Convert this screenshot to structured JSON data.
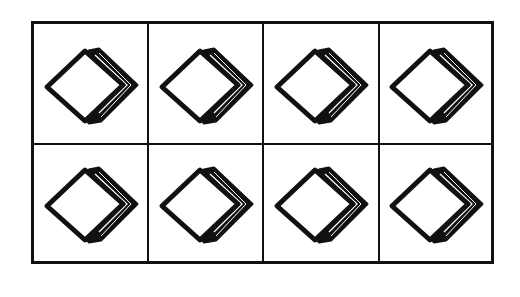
{
  "figure": {
    "rows": 2,
    "columns": 4,
    "cells": [
      {
        "row": 1,
        "col": 1,
        "icon": "book-icon"
      },
      {
        "row": 1,
        "col": 2,
        "icon": "book-icon"
      },
      {
        "row": 1,
        "col": 3,
        "icon": "book-icon"
      },
      {
        "row": 1,
        "col": 4,
        "icon": "book-icon"
      },
      {
        "row": 2,
        "col": 1,
        "icon": "book-icon"
      },
      {
        "row": 2,
        "col": 2,
        "icon": "book-icon"
      },
      {
        "row": 2,
        "col": 3,
        "icon": "book-icon"
      },
      {
        "row": 2,
        "col": 4,
        "icon": "book-icon"
      }
    ],
    "colors": {
      "line": "#111111",
      "background": "#ffffff"
    }
  }
}
